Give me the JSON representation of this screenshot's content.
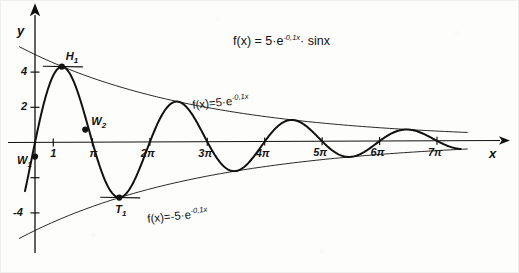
{
  "figure": {
    "title_formula": "f(x) = 5·e⁻⁰˘1ˣ · sinx",
    "axis_x_label": "x",
    "axis_y_label": "y",
    "upper_envelope_label": "f(x)=5·e",
    "upper_envelope_exp": "-0,1x",
    "lower_envelope_label": "f(x)=-5·e",
    "lower_envelope_exp": "-0,1x",
    "title_main": "f(x) = 5·e",
    "title_exp1": "-0,1x",
    "title_tail": "· sinx",
    "ink_color": "#111111",
    "paper_color": "#fdfdfc"
  },
  "y_ticks": [
    {
      "label": "4",
      "value": 4
    },
    {
      "label": "2",
      "value": 2
    },
    {
      "label": "",
      "value": -2
    },
    {
      "label": "-4",
      "value": -4
    }
  ],
  "x_ticks": [
    {
      "label": "1",
      "value": 1
    },
    {
      "label": "π",
      "value": 3.14159
    },
    {
      "label": "2π",
      "value": 6.28319
    },
    {
      "label": "3π",
      "value": 9.42478
    },
    {
      "label": "4π",
      "value": 12.56637
    },
    {
      "label": "5π",
      "value": 15.70796
    },
    {
      "label": "6π",
      "value": 18.84956
    },
    {
      "label": "7π",
      "value": 21.99115
    }
  ],
  "points": [
    {
      "name": "W1",
      "label": "W",
      "sub": "1",
      "x": 0.0,
      "y": -0.8
    },
    {
      "name": "H1",
      "label": "H",
      "sub": "1",
      "x": 1.47,
      "y": 4.31
    },
    {
      "name": "W2",
      "label": "W",
      "sub": "2",
      "x": 2.75,
      "y": 0.72
    },
    {
      "name": "T1",
      "label": "T",
      "sub": "1",
      "x": 4.61,
      "y": -3.15
    }
  ],
  "chart_data": {
    "type": "line",
    "xlabel": "x",
    "ylabel": "y",
    "xlim": [
      -0.4,
      23.6
    ],
    "ylim": [
      -5.6,
      5.6
    ],
    "grid": false,
    "legend": "none",
    "series": [
      {
        "name": "f(x) = 5·e^(-0,1x)·sin x",
        "formula": "5*exp(-0.1*x)*sin(x)",
        "style": "solid-thick",
        "x_range": [
          -0.55,
          23.3
        ]
      },
      {
        "name": "f(x) = 5·e^(-0,1x)",
        "formula": "5*exp(-0.1*x)",
        "style": "solid-thin",
        "x_range": [
          -0.85,
          23.8
        ]
      },
      {
        "name": "f(x) = -5·e^(-0,1x)",
        "formula": "-5*exp(-0.1*x)",
        "style": "solid-thin",
        "x_range": [
          -0.85,
          23.8
        ]
      }
    ],
    "annotations": [
      {
        "text": "H₁",
        "x": 1.47,
        "y": 4.31,
        "note": "maximum, horizontal tangent drawn"
      },
      {
        "text": "T₁",
        "x": 4.61,
        "y": -3.15,
        "note": "minimum, horizontal tangent drawn"
      },
      {
        "text": "W₁",
        "x": 0.0,
        "y": -0.8,
        "note": "inflection point near origin"
      },
      {
        "text": "W₂",
        "x": 2.75,
        "y": 0.72,
        "note": "inflection point before π"
      }
    ],
    "xticks": [
      1,
      3.14159,
      6.28319,
      9.42478,
      12.56637,
      15.70796,
      18.84956,
      21.99115
    ],
    "xticklabels": [
      "1",
      "π",
      "2π",
      "3π",
      "4π",
      "5π",
      "6π",
      "7π"
    ],
    "yticks": [
      4,
      2,
      -2,
      -4
    ],
    "yticklabels": [
      "4",
      "2",
      "",
      "-4"
    ]
  }
}
